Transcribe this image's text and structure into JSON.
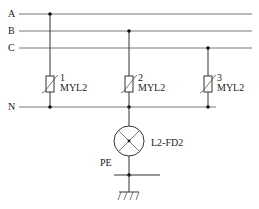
{
  "diagram": {
    "type": "electrical-schematic",
    "buses": [
      {
        "id": "A",
        "label": "A",
        "y": 14
      },
      {
        "id": "B",
        "label": "B",
        "y": 31
      },
      {
        "id": "C",
        "label": "C",
        "y": 48
      },
      {
        "id": "N",
        "label": "N",
        "y": 107
      }
    ],
    "varistors": [
      {
        "index": "1",
        "model": "MYL2",
        "connected_to": "A",
        "x": 50
      },
      {
        "index": "2",
        "model": "MYL2",
        "connected_to": "B",
        "x": 129
      },
      {
        "index": "3",
        "model": "MYL2",
        "connected_to": "C",
        "x": 208
      }
    ],
    "discharge_device": {
      "label": "L2-FD2",
      "between": [
        "N",
        "PE"
      ]
    },
    "ground": {
      "label": "PE"
    },
    "colors": {
      "line": "#333333",
      "background": "#ffffff"
    }
  }
}
